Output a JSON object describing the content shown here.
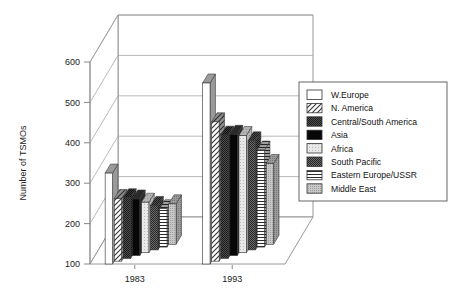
{
  "chart_data": {
    "type": "bar",
    "title": "",
    "subtitle": "",
    "xlabel": "",
    "ylabel": "Number of TSMOs",
    "categories": [
      "1983",
      "1993"
    ],
    "ylim": [
      100,
      600
    ],
    "yticks": [
      100,
      200,
      300,
      400,
      500,
      600
    ],
    "grid": true,
    "legend_position": "right",
    "three_d": true,
    "series": [
      {
        "name": "W.Europe",
        "values": [
          325,
          548
        ],
        "pattern": "solid-white",
        "color": "#ffffff"
      },
      {
        "name": "N. America",
        "values": [
          255,
          445
        ],
        "pattern": "diagonal-hatch",
        "color": "#ffffff"
      },
      {
        "name": "Central/South America",
        "values": [
          250,
          405
        ],
        "pattern": "dark-check",
        "color": "#555555"
      },
      {
        "name": "Asia",
        "values": [
          240,
          400
        ],
        "pattern": "solid-black",
        "color": "#000000"
      },
      {
        "name": "Africa",
        "values": [
          225,
          390
        ],
        "pattern": "light-dots",
        "color": "#dcdcdc"
      },
      {
        "name": "South Pacific",
        "values": [
          210,
          370
        ],
        "pattern": "medium-check",
        "color": "#4a4a4a"
      },
      {
        "name": "Eastern Europe/USSR",
        "values": [
          195,
          340
        ],
        "pattern": "horizontal-lines",
        "color": "#ffffff"
      },
      {
        "name": "Middle East",
        "values": [
          200,
          300
        ],
        "pattern": "gray-dots",
        "color": "#bfbfbf"
      }
    ]
  },
  "axis": {
    "y_title": "Number of TSMOs",
    "y_tick_labels": [
      "600",
      "500",
      "400",
      "300",
      "200",
      "100"
    ],
    "x_tick_labels": [
      "1983",
      "1993"
    ]
  },
  "legend": {
    "items": [
      {
        "label": "W.Europe"
      },
      {
        "label": "N. America"
      },
      {
        "label": "Central/South America"
      },
      {
        "label": "Asia"
      },
      {
        "label": "Africa"
      },
      {
        "label": "South Pacific"
      },
      {
        "label": "Eastern Europe/USSR"
      },
      {
        "label": "Middle East"
      }
    ]
  }
}
